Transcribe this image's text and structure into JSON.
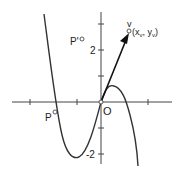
{
  "diagram": {
    "type": "function-plot-with-vector",
    "axes": {
      "y_tick_labels": [
        "2",
        "-2"
      ],
      "origin_label": "O"
    },
    "curve": {
      "description": "cubic curve passing through origin, local min near y=-2, local max near y=0.5",
      "color": "#333333"
    },
    "points": {
      "P": {
        "label": "P"
      },
      "P_prime": {
        "label": "P'"
      },
      "V": {
        "label": "v",
        "coords_label": "(xv, yv)",
        "coords_main": "(x",
        "sub1": "v",
        "mid": ", y",
        "sub2": "v",
        "close": ")"
      }
    },
    "vector": {
      "from": "O",
      "to": "v",
      "color": "#111111"
    },
    "colors": {
      "axis": "#444444",
      "curve": "#333333",
      "vector": "#111111"
    }
  }
}
